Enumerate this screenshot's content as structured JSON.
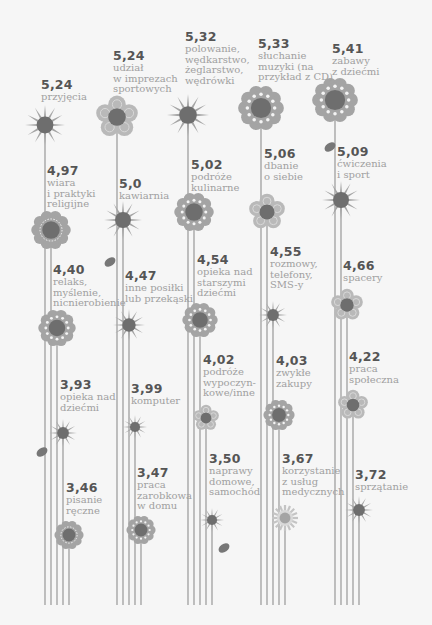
{
  "chart_data": {
    "type": "table",
    "title": "",
    "value_range": [
      3.46,
      5.41
    ],
    "columns": [
      {
        "items": [
          {
            "value": "5,24",
            "label": "przyjęcia",
            "shape": "star"
          },
          {
            "value": "4,97",
            "label": "wiara\ni praktyki\nreligijne",
            "shape": "scalloped"
          },
          {
            "value": "4,40",
            "label": "relaks,\nmyślenie,\nnicnierobienie",
            "shape": "scalloped-dotted"
          },
          {
            "value": "3,93",
            "label": "opieka nad\ndziećmi",
            "shape": "star"
          },
          {
            "value": "3,46",
            "label": "pisanie\nręczne",
            "shape": "scalloped"
          }
        ]
      },
      {
        "items": [
          {
            "value": "5,24",
            "label": "udział\nw imprezach\nsportowych",
            "shape": "five-petal"
          },
          {
            "value": "5,0",
            "label": "kawiarnia",
            "shape": "star"
          },
          {
            "value": "4,47",
            "label": "inne posiłki\nlub przekąski",
            "shape": "star"
          },
          {
            "value": "3,99",
            "label": "komputer",
            "shape": "star"
          },
          {
            "value": "3,47",
            "label": "praca\nzarobkowa\nw domu",
            "shape": "scalloped-dotted"
          }
        ]
      },
      {
        "items": [
          {
            "value": "5,32",
            "label": "polowanie,\nwędkarstwo,\nżeglarstwo,\nwędrówki",
            "shape": "star"
          },
          {
            "value": "5,02",
            "label": "podróże\nkulinarne",
            "shape": "scalloped-dotted"
          },
          {
            "value": "4,54",
            "label": "opieka nad\nstarszymi\ndziećmi",
            "shape": "scalloped-dotted"
          },
          {
            "value": "4,02",
            "label": "podróże\nwypoczyn-\nkowe/inne",
            "shape": "five-petal"
          },
          {
            "value": "3,50",
            "label": "naprawy\ndomowe,\nsamochód",
            "shape": "star"
          }
        ]
      },
      {
        "items": [
          {
            "value": "5,33",
            "label": "słuchanie\nmuzyki (na\nprzykład z CD)",
            "shape": "scalloped-dotted"
          },
          {
            "value": "5,06",
            "label": "dbanie\no siebie",
            "shape": "five-petal"
          },
          {
            "value": "4,55",
            "label": "rozmowy,\ntelefony,\nSMS-y",
            "shape": "star"
          },
          {
            "value": "4,03",
            "label": "zwykłe\nzakupy",
            "shape": "scalloped-dotted"
          },
          {
            "value": "3,67",
            "label": "korzystanie\nz usług\nmedycznych",
            "shape": "spiky"
          }
        ]
      },
      {
        "items": [
          {
            "value": "5,41",
            "label": "zabawy\nz dziećmi",
            "shape": "scalloped-dotted"
          },
          {
            "value": "5,09",
            "label": "ćwiczenia\ni sport",
            "shape": "star"
          },
          {
            "value": "4,66",
            "label": "spacery",
            "shape": "five-petal"
          },
          {
            "value": "4,22",
            "label": "praca\nspołeczna",
            "shape": "five-petal"
          },
          {
            "value": "3,72",
            "label": "sprzątanie",
            "shape": "star"
          }
        ]
      }
    ]
  },
  "colors": {
    "background": "#f6f6f6",
    "stem": "#8f8f8f",
    "petal_light": "#b9b9b9",
    "petal_mid": "#a4a4a4",
    "center": "#6e6e6e",
    "leaf": "#777777",
    "value_text": "#555555",
    "label_text": "#a0a0a0"
  }
}
